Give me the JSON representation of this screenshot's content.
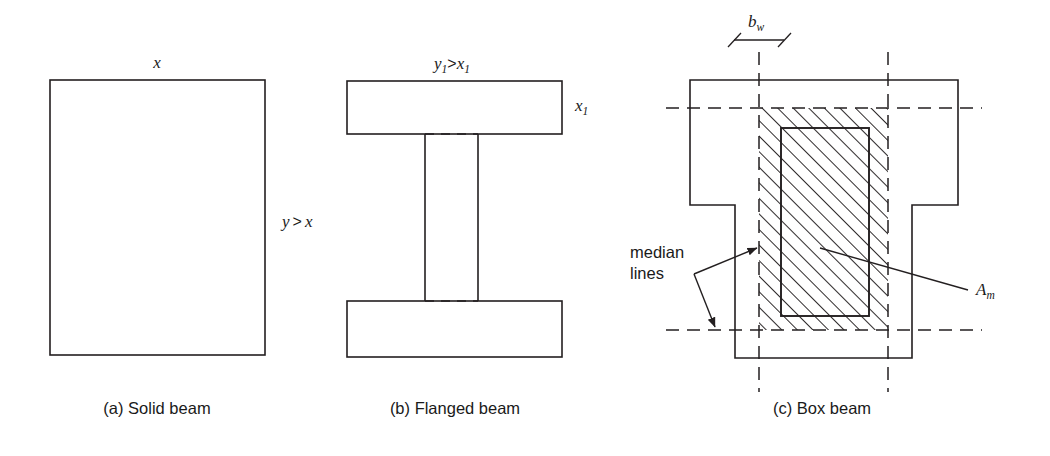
{
  "figure": {
    "background": "#ffffff",
    "ink_color": "#231f20"
  },
  "panels": [
    {
      "id": "a",
      "caption": "(a) Solid beam",
      "shape": "solid-rectangle",
      "labels": {
        "top": "x",
        "right_var1": "y",
        "right_op": ">",
        "right_var2": "x",
        "right_full": "y > x"
      }
    },
    {
      "id": "b",
      "caption": "(b) Flanged beam",
      "shape": "i-beam-flanged",
      "labels": {
        "top_var1": "y",
        "top_sub1": "1",
        "top_op": ">",
        "top_var2": "x",
        "top_sub2": "1",
        "top_full": "y1>x1",
        "right_var": "x",
        "right_sub": "1",
        "right_full": "x1"
      }
    },
    {
      "id": "c",
      "caption": "(c) Box beam",
      "shape": "tee-box-with-hatch",
      "labels": {
        "dimension_var": "b",
        "dimension_sub": "w",
        "dimension_full": "bw",
        "area_var": "A",
        "area_sub": "m",
        "area_full": "Am",
        "median_line1": "median",
        "median_line2": "lines",
        "median_full": "median lines"
      }
    }
  ],
  "icons": {
    "arrowhead": "arrowhead-icon",
    "dimension_tick": "dimension-tick-icon",
    "hatch_pattern": "diagonal-hatch-icon",
    "dashed_median": "dashed-centerline-icon"
  }
}
